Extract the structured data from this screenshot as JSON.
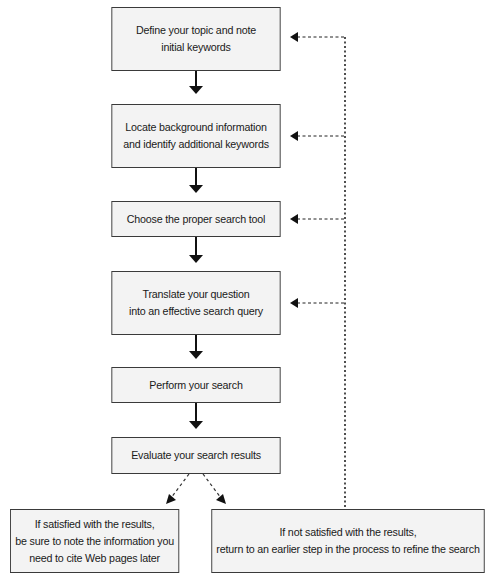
{
  "diagram": {
    "type": "flowchart",
    "steps": [
      {
        "id": "step-1",
        "label": "Define your topic and note\ninitial keywords"
      },
      {
        "id": "step-2",
        "label": "Locate background information\nand identify additional keywords"
      },
      {
        "id": "step-3",
        "label": "Choose the proper search tool"
      },
      {
        "id": "step-4",
        "label": "Translate your question\ninto an effective search query"
      },
      {
        "id": "step-5",
        "label": "Perform your search"
      },
      {
        "id": "step-6",
        "label": "Evaluate your search results"
      }
    ],
    "outcomes": {
      "satisfied": "If satisfied with the results,\nbe sure to note the information you\nneed to cite Web pages later",
      "not_satisfied": "If not satisfied with the results,\nreturn to an earlier step in the process to refine the search"
    },
    "edges": [
      {
        "from": "step-1",
        "to": "step-2",
        "style": "solid"
      },
      {
        "from": "step-2",
        "to": "step-3",
        "style": "solid"
      },
      {
        "from": "step-3",
        "to": "step-4",
        "style": "solid"
      },
      {
        "from": "step-4",
        "to": "step-5",
        "style": "solid"
      },
      {
        "from": "step-5",
        "to": "step-6",
        "style": "solid"
      },
      {
        "from": "step-6",
        "to": "satisfied",
        "style": "dashed"
      },
      {
        "from": "step-6",
        "to": "not_satisfied",
        "style": "dashed"
      },
      {
        "from": "not_satisfied",
        "to": "step-1",
        "style": "dotted"
      },
      {
        "from": "not_satisfied",
        "to": "step-2",
        "style": "dotted"
      },
      {
        "from": "not_satisfied",
        "to": "step-3",
        "style": "dotted"
      },
      {
        "from": "not_satisfied",
        "to": "step-4",
        "style": "dotted"
      }
    ],
    "colors": {
      "box_fill": "#f3f3f3",
      "box_border": "#3a3a3a",
      "line": "#111111",
      "background": "#ffffff"
    }
  }
}
